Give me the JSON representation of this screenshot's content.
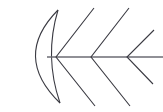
{
  "diagram": {
    "type": "fishbone-ishikawa-skeleton",
    "title": "",
    "width": 163,
    "height": 112,
    "background_color": "#ffffff",
    "stroke_color": "#3a3a42",
    "spine_color": "#6b6b73",
    "stroke_width": 1.1,
    "spine_stroke_width": 1.4,
    "labels": [],
    "head": {
      "name": "fish-head-crescent",
      "top_point": {
        "x": 58,
        "y": 10
      },
      "bottom_point": {
        "x": 60,
        "y": 103
      },
      "outer_arc_bulge": 46,
      "inner_arc_bulge": 14
    },
    "spine": {
      "name": "fish-spine",
      "x1": 47,
      "y1": 57,
      "x2": 163,
      "y2": 57
    },
    "bones": [
      {
        "name": "bone-1",
        "vertex": {
          "x": 56,
          "y": 57
        },
        "upper_end": {
          "x": 94,
          "y": 8
        },
        "lower_end": {
          "x": 95,
          "y": 106
        }
      },
      {
        "name": "bone-2",
        "vertex": {
          "x": 91,
          "y": 57
        },
        "upper_end": {
          "x": 129,
          "y": 8
        },
        "lower_end": {
          "x": 130,
          "y": 106
        }
      },
      {
        "name": "bone-3",
        "vertex": {
          "x": 127,
          "y": 57
        },
        "upper_end": {
          "x": 154,
          "y": 30
        },
        "lower_end": {
          "x": 153,
          "y": 84
        }
      }
    ]
  }
}
